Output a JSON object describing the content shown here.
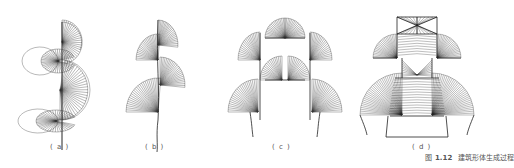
{
  "figure": {
    "caption_prefix": "图",
    "caption_number": "1.12",
    "caption_text": "建筑形体生成过程",
    "panels": [
      {
        "id": "a",
        "label": "( a )"
      },
      {
        "id": "b",
        "label": "( b )"
      },
      {
        "id": "c",
        "label": "( c )"
      },
      {
        "id": "d",
        "label": "( d )"
      }
    ]
  }
}
